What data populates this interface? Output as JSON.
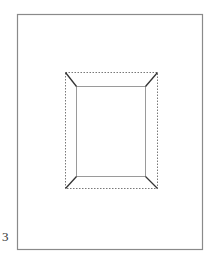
{
  "page": {
    "number_label": "3"
  },
  "diagram": {
    "colors": {
      "page_border": "#8a8a8a",
      "dashed_frame": "#555555",
      "inner_opening": "#9a9a9a",
      "miter_lines": "#333333"
    },
    "page_border": {
      "x": 17,
      "y": 14,
      "w": 186,
      "h": 236
    },
    "outer_frame": {
      "x": 65,
      "y": 72,
      "w": 92,
      "h": 116
    },
    "inner_opening": {
      "x": 76,
      "y": 86,
      "w": 70,
      "h": 91
    }
  }
}
